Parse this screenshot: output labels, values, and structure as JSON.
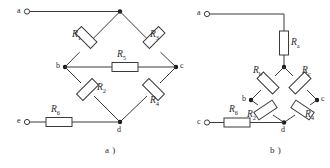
{
  "figure": {
    "type": "circuit-diagram",
    "colors": {
      "background": "#ffffff",
      "wire": "#3a3a3a",
      "node": "#1a1a1a",
      "text": "#2b2b2b"
    }
  },
  "diagrams": [
    {
      "id": "a",
      "caption": "a )",
      "terminals": [
        {
          "name": "terminal-a",
          "label": "a"
        },
        {
          "name": "terminal-e",
          "label": "e"
        }
      ],
      "nodes": [
        {
          "name": "node-top",
          "label": ""
        },
        {
          "name": "node-b",
          "label": "b"
        },
        {
          "name": "node-c",
          "label": "c"
        },
        {
          "name": "node-d",
          "label": "d"
        }
      ],
      "resistors": [
        {
          "name": "resistor-r1",
          "symbol": "R",
          "subscript": "1"
        },
        {
          "name": "resistor-r3",
          "symbol": "R",
          "subscript": "3"
        },
        {
          "name": "resistor-r5",
          "symbol": "R",
          "subscript": "5"
        },
        {
          "name": "resistor-r2",
          "symbol": "R",
          "subscript": "2"
        },
        {
          "name": "resistor-r4",
          "symbol": "R",
          "subscript": "4"
        },
        {
          "name": "resistor-r6",
          "symbol": "R",
          "subscript": "6"
        }
      ]
    },
    {
      "id": "b",
      "caption": "b )",
      "terminals": [
        {
          "name": "terminal-a",
          "label": "a"
        },
        {
          "name": "terminal-c",
          "label": "c"
        }
      ],
      "nodes": [
        {
          "name": "node-top",
          "label": ""
        },
        {
          "name": "node-b",
          "label": "b"
        },
        {
          "name": "node-c",
          "label": "c"
        },
        {
          "name": "node-d",
          "label": "d"
        }
      ],
      "resistors": [
        {
          "name": "resistor-ra",
          "symbol": "R",
          "subscript": "a"
        },
        {
          "name": "resistor-rb",
          "symbol": "R",
          "subscript": "b"
        },
        {
          "name": "resistor-rc",
          "symbol": "R",
          "subscript": "c"
        },
        {
          "name": "resistor-r2",
          "symbol": "R",
          "subscript": "2"
        },
        {
          "name": "resistor-r4",
          "symbol": "R",
          "subscript": "4"
        },
        {
          "name": "resistor-r6",
          "symbol": "R",
          "subscript": "6"
        }
      ]
    }
  ]
}
